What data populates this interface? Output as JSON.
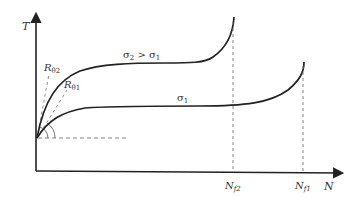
{
  "diagram": {
    "colors": {
      "stroke": "#222222",
      "dashed": "#777777",
      "text": "#333333",
      "background": "#ffffff"
    },
    "axes": {
      "y_label": "T",
      "x_label": "N"
    },
    "curves": [
      {
        "id": "sigma2",
        "label": "σ₂ > σ₁",
        "label_main": "σ",
        "label_sub1": "2",
        "label_mid": " > σ",
        "label_sub2": "1",
        "tangent_label": "R",
        "tangent_sub": "θ2",
        "failure_label": "N",
        "failure_sub": "f2"
      },
      {
        "id": "sigma1",
        "label": "σ₁",
        "label_main": "σ",
        "label_sub1": "1",
        "tangent_label": "R",
        "tangent_sub": "θ1",
        "failure_label": "N",
        "failure_sub": "f1"
      }
    ]
  }
}
